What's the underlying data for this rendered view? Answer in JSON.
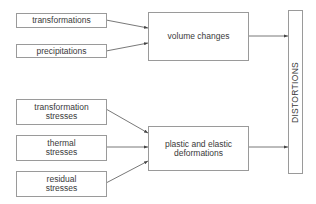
{
  "diagram": {
    "inputs_top": [
      {
        "label": "transformations"
      },
      {
        "label": "precipitations"
      }
    ],
    "inputs_bottom": [
      {
        "label": "transformation\nstresses"
      },
      {
        "label": "thermal\nstresses"
      },
      {
        "label": "residual\nstresses"
      }
    ],
    "middle": [
      {
        "label": "volume changes"
      },
      {
        "label": "plastic and elastic\ndeformations"
      }
    ],
    "output": {
      "label": "DISTORTIONS"
    },
    "line_color": "#444444",
    "border_color": "#9a9a9a"
  }
}
